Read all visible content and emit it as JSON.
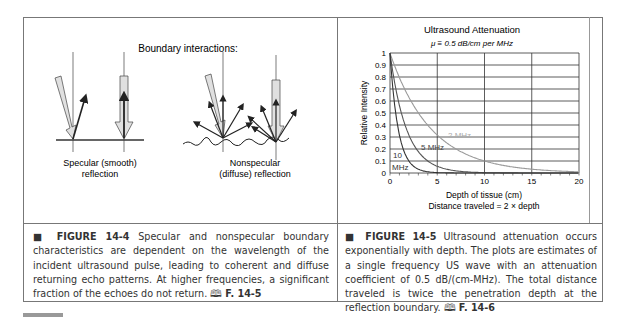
{
  "figure_left": {
    "title": "Boundary interactions:",
    "specular_label_1": "Specular (smooth)",
    "specular_label_2": "reflection",
    "nonspecular_label_1": "Nonspecular",
    "nonspecular_label_2": "(diffuse) reflection",
    "caption_label": "FIGURE 14-4",
    "caption_text": "Specular and nonspecular boundary characteristics are dependent on the wavelength of the incident ultrasound pulse, leading to coherent and diffuse returning echo patterns. At higher frequencies, a significant fraction of the echoes do not return.",
    "caption_ref": "F. 14-5"
  },
  "figure_right": {
    "caption_label": "FIGURE 14-5",
    "caption_text": "Ultrasound attenuation occurs exponentially with depth. The plots are estimates of a single frequency US wave with an attenuation coefficient of 0.5 dB/(cm-MHz). The total distance traveled is twice the penetration depth at the reflection boundary.",
    "caption_ref": "F. 14-6"
  },
  "book_icon": "open-book-icon",
  "chart_data": {
    "type": "line",
    "title": "Ultrasound Attenuation",
    "subtitle": "μ ≡ 0.5 dB/cm per MHz",
    "xlabel": "Depth of tissue (cm)",
    "xlabel2": "Distance traveled = 2 × depth",
    "ylabel": "Relative Intensity",
    "xlim": [
      0,
      20
    ],
    "ylim": [
      0,
      1
    ],
    "xticks": [
      0,
      5,
      10,
      15,
      20
    ],
    "yticks": [
      0,
      0.1,
      0.2,
      0.3,
      0.4,
      0.5,
      0.6,
      0.7,
      0.8,
      0.9,
      1
    ],
    "grid": true,
    "x": [
      0,
      1,
      2,
      3,
      4,
      5,
      6,
      7,
      8,
      9,
      10,
      11,
      12,
      13,
      14,
      15,
      16,
      17,
      18,
      19,
      20
    ],
    "series": [
      {
        "name": "2 MHz",
        "color": "#9a9a9a",
        "values": [
          1.0,
          0.79,
          0.63,
          0.5,
          0.4,
          0.32,
          0.25,
          0.2,
          0.16,
          0.13,
          0.1,
          0.08,
          0.06,
          0.05,
          0.04,
          0.03,
          0.03,
          0.02,
          0.02,
          0.01,
          0.01
        ]
      },
      {
        "name": "5 MHz",
        "color": "#555555",
        "values": [
          1.0,
          0.56,
          0.32,
          0.18,
          0.1,
          0.06,
          0.03,
          0.02,
          0.01,
          0.01,
          0.0,
          0,
          0,
          0,
          0,
          0,
          0,
          0,
          0,
          0,
          0
        ]
      },
      {
        "name": "10 MHz",
        "color": "#333333",
        "values": [
          1.0,
          0.32,
          0.1,
          0.03,
          0.01,
          0.0,
          0,
          0,
          0,
          0,
          0,
          0,
          0,
          0,
          0,
          0,
          0,
          0,
          0,
          0,
          0
        ]
      }
    ],
    "annotations": [
      "2 MHz",
      "5 MHz",
      "10 MHz"
    ]
  }
}
